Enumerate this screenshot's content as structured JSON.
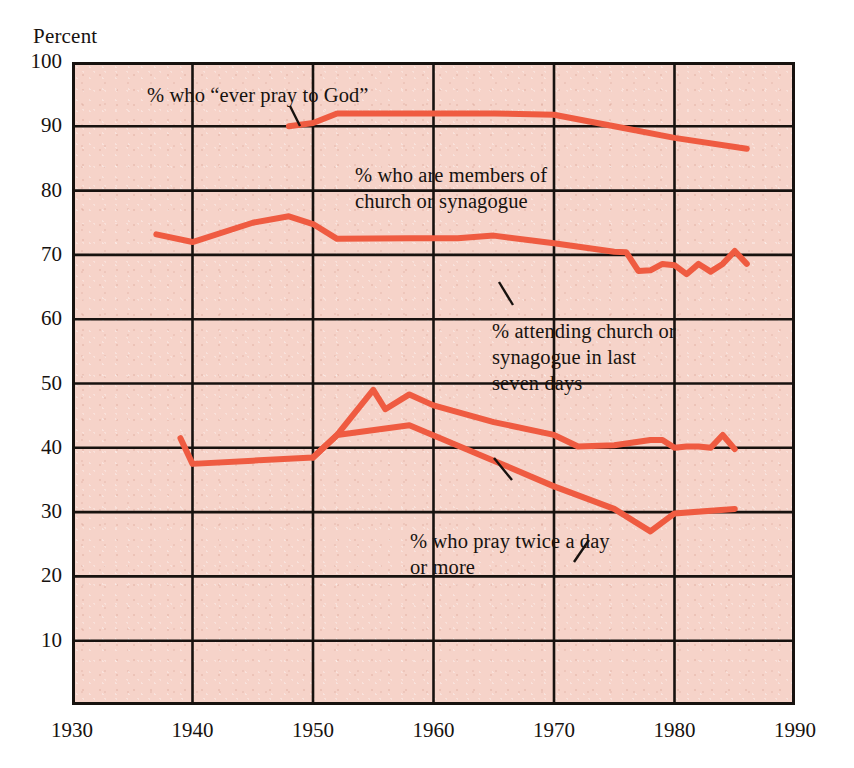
{
  "chart_data": {
    "type": "line",
    "title": "",
    "subtitle": "",
    "xlabel": "",
    "ylabel": "Percent",
    "xlim": [
      1930,
      1990
    ],
    "ylim": [
      0,
      100
    ],
    "grid": true,
    "legend_position": "inline-annotations",
    "x_ticks": [
      1930,
      1940,
      1950,
      1960,
      1970,
      1980,
      1990
    ],
    "y_ticks": [
      10,
      20,
      30,
      40,
      50,
      60,
      70,
      80,
      90,
      100
    ],
    "line_color": "#ef5b41",
    "plot_background": "#f6d3c9",
    "axis_color": "#17120f",
    "series": [
      {
        "name": "% who \"ever pray to God\"",
        "label": "% who “ever pray to God”",
        "points": [
          [
            1948,
            90.0
          ],
          [
            1950,
            90.5
          ],
          [
            1952,
            92.0
          ],
          [
            1960,
            92.0
          ],
          [
            1965,
            92.0
          ],
          [
            1970,
            91.8
          ],
          [
            1975,
            90.0
          ],
          [
            1980,
            88.2
          ],
          [
            1986,
            86.5
          ]
        ]
      },
      {
        "name": "% who are members of church or synagogue",
        "label": "% who are members of\nchurch or synagogue",
        "points": [
          [
            1937,
            73.2
          ],
          [
            1940,
            72.0
          ],
          [
            1945,
            75.0
          ],
          [
            1948,
            76.0
          ],
          [
            1950,
            74.8
          ],
          [
            1952,
            72.5
          ],
          [
            1958,
            72.6
          ],
          [
            1962,
            72.6
          ],
          [
            1965,
            73.0
          ],
          [
            1970,
            71.8
          ],
          [
            1975,
            70.5
          ],
          [
            1976,
            70.4
          ],
          [
            1977,
            67.5
          ],
          [
            1978,
            67.6
          ],
          [
            1979,
            68.6
          ],
          [
            1980,
            68.4
          ],
          [
            1981,
            67.0
          ],
          [
            1982,
            68.6
          ],
          [
            1983,
            67.4
          ],
          [
            1984,
            68.6
          ],
          [
            1985,
            70.6
          ],
          [
            1986,
            68.6
          ]
        ]
      },
      {
        "name": "% attending church or synagogue in last seven days",
        "label": "% attending church or\nsynagogue in last\nseven days",
        "points": [
          [
            1950,
            38.5
          ],
          [
            1952,
            42.0
          ],
          [
            1955,
            49.0
          ],
          [
            1956,
            46.0
          ],
          [
            1958,
            48.3
          ],
          [
            1960,
            46.6
          ],
          [
            1965,
            44.0
          ],
          [
            1970,
            42.0
          ],
          [
            1972,
            40.2
          ],
          [
            1975,
            40.4
          ],
          [
            1978,
            41.2
          ],
          [
            1979,
            41.2
          ],
          [
            1980,
            40.0
          ],
          [
            1981,
            40.2
          ],
          [
            1982,
            40.2
          ],
          [
            1983,
            40.0
          ],
          [
            1984,
            42.0
          ],
          [
            1985,
            39.8
          ]
        ]
      },
      {
        "name": "% who pray twice a day or more",
        "label": "% who pray twice a day\nor more",
        "points": [
          [
            1939,
            41.5
          ],
          [
            1940,
            37.5
          ],
          [
            1945,
            38.0
          ],
          [
            1950,
            38.5
          ],
          [
            1952,
            42.0
          ],
          [
            1958,
            43.5
          ],
          [
            1965,
            38.0
          ],
          [
            1970,
            34.0
          ],
          [
            1975,
            30.5
          ],
          [
            1978,
            27.0
          ],
          [
            1980,
            29.8
          ],
          [
            1985,
            30.5
          ]
        ]
      }
    ]
  },
  "axis": {
    "y_caption": "Percent",
    "y_tick_labels": [
      "100",
      "90",
      "80",
      "70",
      "60",
      "50",
      "40",
      "30",
      "20",
      "10"
    ],
    "x_tick_labels": [
      "1930",
      "1940",
      "1950",
      "1960",
      "1970",
      "1980",
      "1990"
    ]
  },
  "annotations": [
    {
      "id": "ever-pray",
      "text": "% who “ever pray to God”"
    },
    {
      "id": "members",
      "text": "% who are members of\nchurch or synagogue"
    },
    {
      "id": "attending",
      "text": "% attending church or\nsynagogue in last\nseven days"
    },
    {
      "id": "pray-twice",
      "text": "% who pray twice a day\nor more"
    }
  ]
}
